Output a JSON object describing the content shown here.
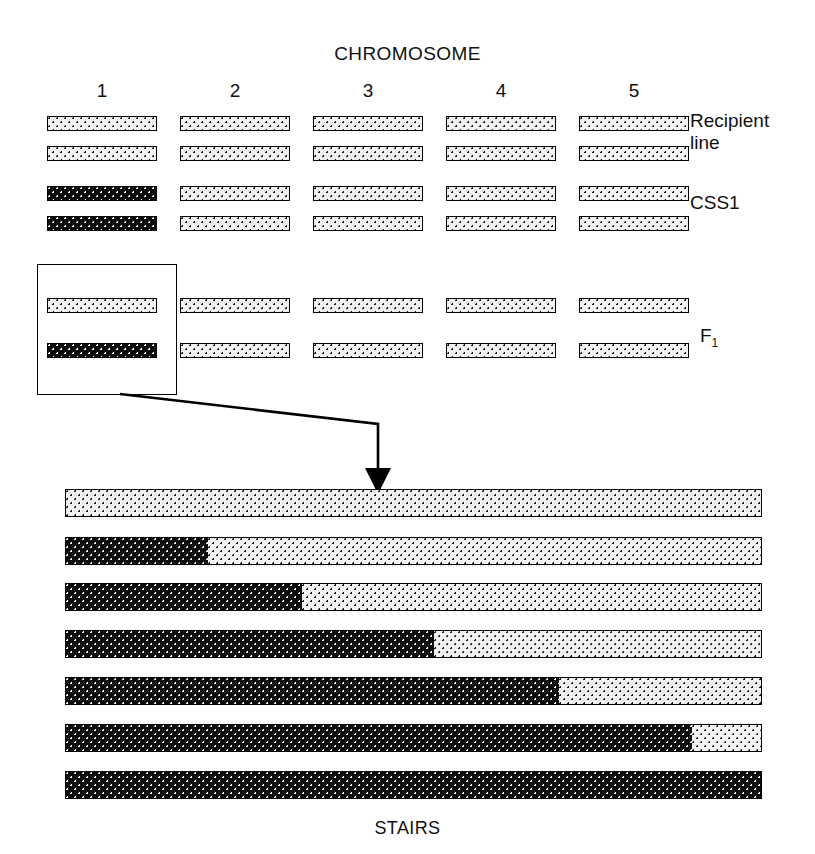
{
  "figure": {
    "title": "CHROMOSOME",
    "bottom_label": "STAIRS",
    "colors": {
      "donor_fill": "#0c0c0c",
      "recipient_fill": "#f2f2f2",
      "outline": "#000000",
      "donor_dot": "#ffffff",
      "recipient_dot": "#1a1a1a"
    }
  },
  "chromosome_headers": [
    {
      "label": "1"
    },
    {
      "label": "2"
    },
    {
      "label": "3"
    },
    {
      "label": "4"
    },
    {
      "label": "5"
    }
  ],
  "genotype_rows": [
    {
      "name": "recipient-line",
      "label_line1": "Recipient",
      "label_line2": "line",
      "homologs": [
        {
          "segments": [
            {
              "type": "recipient",
              "fraction": 1.0
            }
          ]
        },
        {
          "segments": [
            {
              "type": "recipient",
              "fraction": 1.0
            }
          ]
        }
      ],
      "chromosomes": [
        {
          "number": "1",
          "top": "recipient",
          "bottom": "recipient"
        },
        {
          "number": "2",
          "top": "recipient",
          "bottom": "recipient"
        },
        {
          "number": "3",
          "top": "recipient",
          "bottom": "recipient"
        },
        {
          "number": "4",
          "top": "recipient",
          "bottom": "recipient"
        },
        {
          "number": "5",
          "top": "recipient",
          "bottom": "recipient"
        }
      ]
    },
    {
      "name": "css1",
      "label_line1": "CSS1",
      "label_line2": "",
      "chromosomes": [
        {
          "number": "1",
          "top": "donor",
          "bottom": "donor"
        },
        {
          "number": "2",
          "top": "recipient",
          "bottom": "recipient"
        },
        {
          "number": "3",
          "top": "recipient",
          "bottom": "recipient"
        },
        {
          "number": "4",
          "top": "recipient",
          "bottom": "recipient"
        },
        {
          "number": "5",
          "top": "recipient",
          "bottom": "recipient"
        }
      ]
    },
    {
      "name": "f1",
      "label_line1": "F",
      "label_sub": "1",
      "label_line2": "",
      "chromosomes": [
        {
          "number": "1",
          "top": "recipient",
          "bottom": "donor"
        },
        {
          "number": "2",
          "top": "recipient",
          "bottom": "recipient"
        },
        {
          "number": "3",
          "top": "recipient",
          "bottom": "recipient"
        },
        {
          "number": "4",
          "top": "recipient",
          "bottom": "recipient"
        },
        {
          "number": "5",
          "top": "recipient",
          "bottom": "recipient"
        }
      ]
    }
  ],
  "callout": {
    "target_row": "f1",
    "target_chromosome": "1",
    "arrow_direction": "down"
  },
  "chart_data": {
    "type": "bar",
    "title": "STAIRS",
    "xlabel": "",
    "ylabel": "",
    "categories": [
      "STAIRS line 1",
      "STAIRS line 2",
      "STAIRS line 3",
      "STAIRS line 4",
      "STAIRS line 5",
      "STAIRS line 6",
      "STAIRS line 7"
    ],
    "series": [
      {
        "name": "Donor (CSS1) segment fraction",
        "values": [
          0.0,
          0.205,
          0.34,
          0.53,
          0.71,
          0.9,
          1.0
        ]
      },
      {
        "name": "Recipient segment fraction",
        "values": [
          1.0,
          0.795,
          0.66,
          0.47,
          0.29,
          0.1,
          0.0
        ]
      }
    ],
    "xlim": [
      0,
      1
    ],
    "grid": false,
    "legend": "none",
    "note": "Each horizontal bar is one chromosome 1; black (donor) region grows stepwise from the left end."
  },
  "stairs_bars": [
    {
      "index": 1,
      "donor_fraction": 0.0
    },
    {
      "index": 2,
      "donor_fraction": 0.205
    },
    {
      "index": 3,
      "donor_fraction": 0.34
    },
    {
      "index": 4,
      "donor_fraction": 0.53
    },
    {
      "index": 5,
      "donor_fraction": 0.71
    },
    {
      "index": 6,
      "donor_fraction": 0.9
    },
    {
      "index": 7,
      "donor_fraction": 1.0
    }
  ]
}
